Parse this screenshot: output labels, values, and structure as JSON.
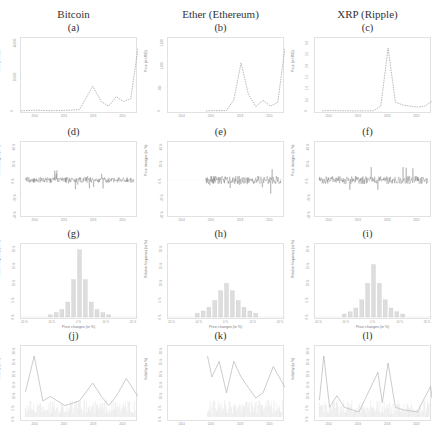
{
  "columns": [
    {
      "title": "Bitcoin"
    },
    {
      "title": "Ether (Ethereum)"
    },
    {
      "title": "XRP (Ripple)"
    }
  ],
  "panels": {
    "a": {
      "label": "(a)",
      "ylabel": "Price (in USD)"
    },
    "b": {
      "label": "(b)",
      "ylabel": "Price (in USD)"
    },
    "c": {
      "label": "(c)",
      "ylabel": "Price (in USD)"
    },
    "d": {
      "label": "(d)",
      "ylabel": "Price changes (in %)"
    },
    "e": {
      "label": "(e)",
      "ylabel": "Price changes (in %)"
    },
    "f": {
      "label": "(f)",
      "ylabel": "Price changes (in %)"
    },
    "g": {
      "label": "(g)",
      "ylabel": "Relative frequency (in %)",
      "xlabel": "Price changes (in %)"
    },
    "h": {
      "label": "(h)",
      "ylabel": "Relative frequency (in %)",
      "xlabel": "Price changes (in %)"
    },
    "i": {
      "label": "(i)",
      "ylabel": "Relative frequency (in %)",
      "xlabel": "Price changes (in %)"
    },
    "j": {
      "label": "(j)",
      "ylabel": "Volatility (in %)"
    },
    "k": {
      "label": "(k)",
      "ylabel": "Volatility (in %)"
    },
    "l": {
      "label": "(l)",
      "ylabel": "Volatility (in %)"
    }
  },
  "year_ticks": [
    "2014",
    "2016",
    "2018",
    "2020"
  ],
  "change_ticks": [
    "-40 %",
    "-20 %",
    "0 %",
    "20 %",
    "40 %"
  ],
  "hist_x_ticks": [
    "-20 %",
    "-10 %",
    "0 %",
    "10 %",
    "20 %"
  ],
  "hist_y_ticks": [
    "0 %",
    "5 %",
    "10 %",
    "15 %",
    "20 %"
  ],
  "vol_ticks": [
    "0 %",
    "5 %",
    "10 %",
    "15 %",
    "20 %",
    "25 %",
    "30 %"
  ],
  "price_ticks": {
    "bitcoin": [
      "0",
      "20,000",
      "40,000"
    ],
    "ether": [
      "0",
      "500",
      "1,000",
      "1,500"
    ],
    "xrp": [
      "0",
      "0.5",
      "1.0",
      "1.5",
      "2.0",
      "2.5",
      "3.0"
    ]
  },
  "chart_data": [
    {
      "panel": "a",
      "type": "line",
      "title": "Bitcoin price",
      "ylabel": "Price (in USD)",
      "x": [
        "2013",
        "2014",
        "2015",
        "2016",
        "2017",
        "2017.9",
        "2018.5",
        "2019",
        "2019.5",
        "2020",
        "2020.5",
        "2021"
      ],
      "values": [
        100,
        600,
        250,
        430,
        1000,
        19000,
        7000,
        3700,
        11000,
        7200,
        9200,
        48000
      ],
      "xlim": [
        "2013",
        "2021"
      ]
    },
    {
      "panel": "b",
      "type": "line",
      "title": "Ether price",
      "ylabel": "Price (in USD)",
      "x": [
        "2015.6",
        "2016",
        "2017",
        "2017.5",
        "2018.0",
        "2018.5",
        "2019",
        "2019.5",
        "2020",
        "2020.5",
        "2021"
      ],
      "values": [
        1,
        10,
        10,
        300,
        1300,
        450,
        120,
        290,
        130,
        230,
        1700
      ],
      "xlim": [
        "2013",
        "2021"
      ]
    },
    {
      "panel": "c",
      "type": "line",
      "title": "XRP price",
      "ylabel": "Price (in USD)",
      "x": [
        "2013.5",
        "2014",
        "2015",
        "2016",
        "2017",
        "2017.5",
        "2018.0",
        "2018.5",
        "2019",
        "2020",
        "2020.5",
        "2021"
      ],
      "values": [
        0.01,
        0.02,
        0.01,
        0.006,
        0.01,
        0.25,
        3.2,
        0.45,
        0.3,
        0.2,
        0.25,
        0.5
      ],
      "xlim": [
        "2013",
        "2021"
      ]
    },
    {
      "panel": "d",
      "type": "line",
      "title": "Bitcoin daily price changes",
      "ylabel": "Price changes (in %)",
      "ylim": [
        -40,
        40
      ],
      "note": "noisy series centered at 0%, spikes up to about ±25% in 2013-2014"
    },
    {
      "panel": "e",
      "type": "line",
      "title": "Ether daily price changes",
      "ylabel": "Price changes (in %)",
      "ylim": [
        -40,
        40
      ],
      "note": "series starts 2015.6, spikes up to about ±35%"
    },
    {
      "panel": "f",
      "type": "line",
      "title": "XRP daily price changes",
      "ylabel": "Price changes (in %)",
      "ylim": [
        -40,
        40
      ],
      "note": "spikes up to about ±40% in 2013, 2017-2018 and 2020"
    },
    {
      "panel": "g",
      "type": "bar",
      "title": "Bitcoin price change distribution",
      "xlabel": "Price changes (in %)",
      "ylabel": "Relative frequency (in %)",
      "categories": [
        -10,
        -8,
        -6,
        -4,
        -2,
        0,
        2,
        4,
        6,
        8,
        10
      ],
      "values": [
        0.3,
        0.6,
        1,
        2,
        5,
        9,
        5,
        2,
        1,
        0.6,
        0.3
      ],
      "xlim": [
        -20,
        20
      ]
    },
    {
      "panel": "h",
      "type": "bar",
      "title": "Ether price change distribution",
      "xlabel": "Price changes (in %)",
      "ylabel": "Relative frequency (in %)",
      "categories": [
        -10,
        -8,
        -6,
        -4,
        -2,
        0,
        2,
        4,
        6,
        8,
        10
      ],
      "values": [
        0.5,
        0.8,
        1.3,
        2.2,
        3.5,
        4.5,
        3.5,
        2.2,
        1.3,
        0.8,
        0.5
      ],
      "xlim": [
        -20,
        20
      ]
    },
    {
      "panel": "i",
      "type": "bar",
      "title": "XRP price change distribution",
      "xlabel": "Price changes (in %)",
      "ylabel": "Relative frequency (in %)",
      "categories": [
        -10,
        -8,
        -6,
        -4,
        -2,
        0,
        2,
        4,
        6,
        8,
        10
      ],
      "values": [
        0.4,
        0.7,
        1.2,
        2.3,
        4.5,
        7,
        4.5,
        2.3,
        1.2,
        0.7,
        0.4
      ],
      "xlim": [
        -20,
        20
      ]
    },
    {
      "panel": "j",
      "type": "line",
      "title": "Bitcoin volatility",
      "ylabel": "Volatility (in %)",
      "x": [
        "2013.3",
        "2013.9",
        "2014.5",
        "2015",
        "2016",
        "2017",
        "2017.9",
        "2018.5",
        "2019",
        "2019.5",
        "2020.2",
        "2021"
      ],
      "values": [
        6,
        14,
        4,
        5,
        3,
        4,
        8,
        5,
        3,
        5,
        9,
        5
      ]
    },
    {
      "panel": "k",
      "type": "line",
      "title": "Ether volatility",
      "ylabel": "Volatility (in %)",
      "x": [
        "2015.7",
        "2016",
        "2016.5",
        "2017",
        "2017.5",
        "2018",
        "2018.5",
        "2019",
        "2019.5",
        "2020.2",
        "2021"
      ],
      "values": [
        12,
        8,
        11,
        5,
        11,
        8,
        6,
        4,
        5,
        10,
        6
      ]
    },
    {
      "panel": "l",
      "type": "line",
      "title": "XRP volatility",
      "ylabel": "Volatility (in %)",
      "x": [
        "2013.3",
        "2013.6",
        "2014",
        "2014.5",
        "2015",
        "2016",
        "2017.3",
        "2017.6",
        "2018",
        "2018.5",
        "2019",
        "2020",
        "2020.9",
        "2021"
      ],
      "values": [
        8,
        27,
        5,
        10,
        5,
        3,
        20,
        7,
        24,
        5,
        4,
        3,
        14,
        9
      ]
    }
  ]
}
